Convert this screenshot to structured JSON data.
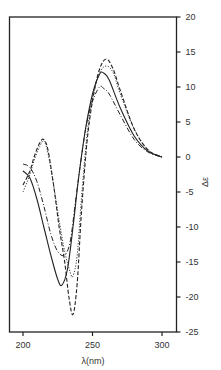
{
  "chart_data": {
    "type": "line",
    "title": "",
    "xlabel": "λ(nm)",
    "ylabel": "Δε",
    "xlim": [
      191,
      310
    ],
    "ylim": [
      -25,
      20
    ],
    "xticks": [
      200,
      250,
      300
    ],
    "yticks": [
      20,
      15,
      10,
      5,
      0,
      -5,
      -10,
      -15,
      -20,
      -25
    ],
    "y_axis_position": "right",
    "grid": false,
    "legend": null,
    "series": [
      {
        "name": "solid",
        "style": "solid",
        "x": [
          200,
          205,
          210,
          215,
          220,
          225,
          228,
          232,
          236,
          240,
          245,
          250,
          255,
          258,
          262,
          270,
          280,
          290,
          300
        ],
        "values": [
          -2,
          -3,
          -6,
          -10,
          -14,
          -17.5,
          -18.3,
          -16,
          -10,
          -3,
          4,
          9,
          11.8,
          12,
          11,
          7,
          3,
          0.8,
          0
        ]
      },
      {
        "name": "dashed",
        "style": "dashed",
        "x": [
          200,
          205,
          208,
          212,
          215,
          218,
          222,
          226,
          230,
          233,
          236,
          239,
          242,
          246,
          250,
          255,
          260,
          265,
          270,
          280,
          290,
          300
        ],
        "values": [
          -4,
          -2,
          0,
          2,
          2.5,
          1,
          -4,
          -10,
          -15,
          -20,
          -22.5,
          -18,
          -8,
          2,
          8,
          12.5,
          14,
          12.5,
          9.5,
          4,
          1,
          0
        ]
      },
      {
        "name": "dotted",
        "style": "dotted",
        "x": [
          200,
          205,
          208,
          212,
          215,
          218,
          222,
          226,
          230,
          234,
          236,
          239,
          242,
          246,
          250,
          255,
          260,
          265,
          270,
          280,
          290,
          300
        ],
        "values": [
          -5,
          -2.5,
          -0.5,
          1.5,
          2.3,
          0.5,
          -4,
          -9,
          -13.5,
          -16.5,
          -17,
          -14,
          -6,
          3,
          8.5,
          12,
          13,
          12,
          9,
          4,
          1,
          0
        ]
      },
      {
        "name": "dash-dot",
        "style": "dashdot",
        "x": [
          200,
          205,
          210,
          215,
          220,
          225,
          230,
          234,
          238,
          242,
          246,
          250,
          255,
          258,
          262,
          270,
          280,
          290,
          300
        ],
        "values": [
          -1,
          -1.5,
          -3.5,
          -7,
          -11,
          -13.5,
          -14,
          -12,
          -6,
          0,
          5,
          8,
          10,
          9.8,
          9,
          6,
          2.5,
          0.7,
          0
        ]
      }
    ]
  }
}
